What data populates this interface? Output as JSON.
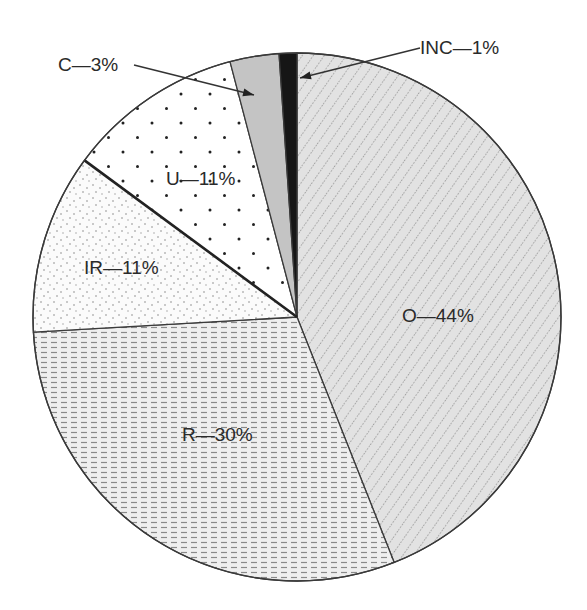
{
  "chart_data": {
    "type": "pie",
    "title": "",
    "start_angle_deg": 0,
    "direction": "clockwise",
    "slices": [
      {
        "key": "O",
        "label": "O—44%",
        "value": 44,
        "pattern": "diag",
        "fill": "#e2e2e2",
        "start_deg": 0,
        "end_deg": 158.4
      },
      {
        "key": "R",
        "label": "R—30%",
        "value": 30,
        "pattern": "dash",
        "fill": "#ededed",
        "start_deg": 158.4,
        "end_deg": 266.7
      },
      {
        "key": "IR",
        "label": "IR—11%",
        "value": 11,
        "pattern": "finedot",
        "fill": "#f7f7f7",
        "start_deg": 266.7,
        "end_deg": 306.4
      },
      {
        "key": "U",
        "label": "U—11%",
        "value": 11,
        "pattern": "bigdot",
        "fill": "#ffffff",
        "start_deg": 306.4,
        "end_deg": 345.3
      },
      {
        "key": "C",
        "label": "C—3%",
        "value": 3,
        "pattern": "solid",
        "fill": "#c4c4c4",
        "start_deg": 345.3,
        "end_deg": 356.1
      },
      {
        "key": "INC",
        "label": "INC—1%",
        "value": 1,
        "pattern": "solid",
        "fill": "#161616",
        "start_deg": 356.1,
        "end_deg": 360
      }
    ],
    "labels": {
      "O": {
        "x": 402,
        "y": 322
      },
      "R": {
        "x": 182,
        "y": 441
      },
      "IR": {
        "x": 84,
        "y": 274
      },
      "U": {
        "x": 166,
        "y": 185
      },
      "C": {
        "x": 58,
        "y": 71
      },
      "INC": {
        "x": 420,
        "y": 54
      }
    },
    "callouts": {
      "C": {
        "x1": 134,
        "y1": 65,
        "x2": 254,
        "y2": 95
      },
      "INC": {
        "x1": 420,
        "y1": 48,
        "x2": 300,
        "y2": 78
      }
    },
    "geometry": {
      "cx": 297,
      "cy": 317,
      "r": 264
    },
    "legend": "none",
    "grid": false
  }
}
